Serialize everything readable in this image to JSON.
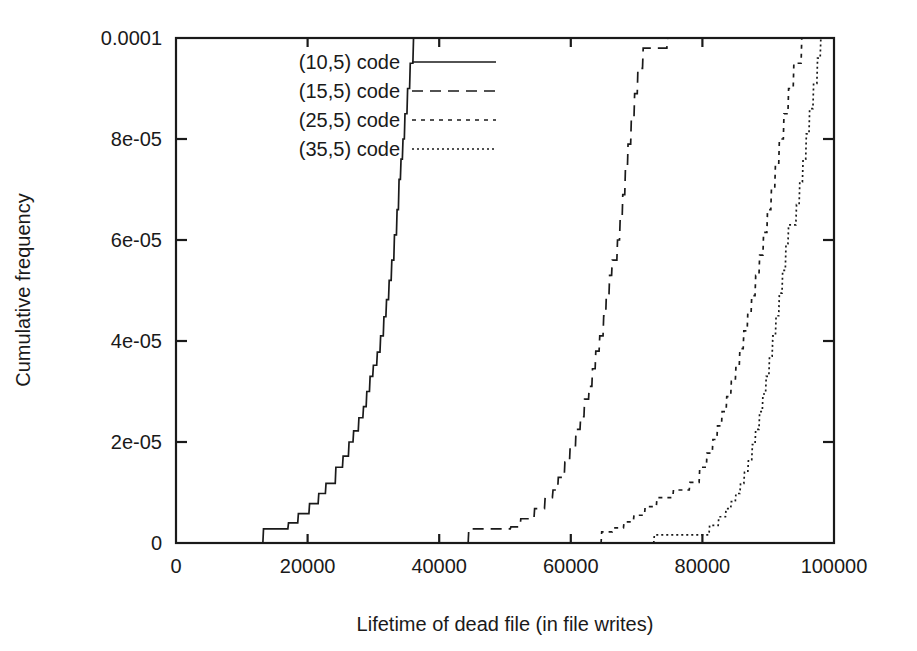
{
  "chart_data": {
    "type": "line",
    "title": "",
    "subtitle": "",
    "xlabel": "Lifetime of dead file (in file writes)",
    "ylabel": "Cumulative frequency",
    "xlim": [
      0,
      100000
    ],
    "ylim": [
      0,
      0.0001
    ],
    "grid": false,
    "legend_position": "top-left-inside",
    "xticks": [
      0,
      20000,
      40000,
      60000,
      80000,
      100000
    ],
    "xticklabels": [
      "0",
      "20000",
      "40000",
      "60000",
      "80000",
      "100000"
    ],
    "yticks": [
      0,
      2e-05,
      4e-05,
      6e-05,
      8e-05,
      0.0001
    ],
    "yticklabels": [
      "0",
      "2e-05",
      "4e-05",
      "6e-05",
      "8e-05",
      "0.0001"
    ],
    "series": [
      {
        "name": "(10,5) code",
        "linestyle": "solid",
        "dasharray": "",
        "points": [
          [
            13200,
            0.0
          ],
          [
            13300,
            2.8e-06
          ],
          [
            17000,
            2.8e-06
          ],
          [
            17100,
            4e-06
          ],
          [
            18500,
            4e-06
          ],
          [
            18600,
            5.8e-06
          ],
          [
            20200,
            5.8e-06
          ],
          [
            20300,
            7.8e-06
          ],
          [
            21600,
            7.8e-06
          ],
          [
            21700,
            9.8e-06
          ],
          [
            22700,
            9.8e-06
          ],
          [
            22800,
            1.18e-05
          ],
          [
            24200,
            1.18e-05
          ],
          [
            24300,
            1.5e-05
          ],
          [
            25300,
            1.5e-05
          ],
          [
            25400,
            1.72e-05
          ],
          [
            26200,
            1.72e-05
          ],
          [
            26300,
            2e-05
          ],
          [
            26900,
            2e-05
          ],
          [
            27000,
            2.22e-05
          ],
          [
            27700,
            2.22e-05
          ],
          [
            27800,
            2.48e-05
          ],
          [
            28400,
            2.48e-05
          ],
          [
            28500,
            2.7e-05
          ],
          [
            28900,
            2.7e-05
          ],
          [
            29000,
            3e-05
          ],
          [
            29400,
            3e-05
          ],
          [
            29500,
            3.3e-05
          ],
          [
            29900,
            3.3e-05
          ],
          [
            30000,
            3.52e-05
          ],
          [
            30500,
            3.52e-05
          ],
          [
            30600,
            3.78e-05
          ],
          [
            31000,
            3.78e-05
          ],
          [
            31100,
            4.1e-05
          ],
          [
            31500,
            4.1e-05
          ],
          [
            31600,
            4.48e-05
          ],
          [
            31900,
            4.48e-05
          ],
          [
            32000,
            4.82e-05
          ],
          [
            32300,
            4.82e-05
          ],
          [
            32400,
            5.2e-05
          ],
          [
            32700,
            5.2e-05
          ],
          [
            32800,
            5.6e-05
          ],
          [
            33100,
            5.6e-05
          ],
          [
            33200,
            6.1e-05
          ],
          [
            33500,
            6.1e-05
          ],
          [
            33600,
            6.6e-05
          ],
          [
            33800,
            6.6e-05
          ],
          [
            33900,
            7.2e-05
          ],
          [
            34100,
            7.2e-05
          ],
          [
            34200,
            7.6e-05
          ],
          [
            34400,
            7.6e-05
          ],
          [
            34500,
            8e-05
          ],
          [
            34700,
            8e-05
          ],
          [
            34800,
            8.5e-05
          ],
          [
            35100,
            8.5e-05
          ],
          [
            35200,
            9e-05
          ],
          [
            35500,
            9e-05
          ],
          [
            35600,
            9.5e-05
          ],
          [
            36000,
            9.5e-05
          ],
          [
            36100,
            0.0001
          ]
        ]
      },
      {
        "name": "(15,5) code",
        "linestyle": "dashed",
        "dasharray": "11,7",
        "points": [
          [
            44400,
            0.0
          ],
          [
            44500,
            2.8e-06
          ],
          [
            50800,
            2.8e-06
          ],
          [
            50900,
            3.2e-06
          ],
          [
            52300,
            3.2e-06
          ],
          [
            52400,
            4.8e-06
          ],
          [
            54400,
            4.8e-06
          ],
          [
            54500,
            6.8e-06
          ],
          [
            56000,
            6.8e-06
          ],
          [
            56100,
            9e-06
          ],
          [
            57200,
            9e-06
          ],
          [
            57300,
            1.05e-05
          ],
          [
            58000,
            1.05e-05
          ],
          [
            58100,
            1.3e-05
          ],
          [
            59000,
            1.3e-05
          ],
          [
            59100,
            1.6e-05
          ],
          [
            59800,
            1.6e-05
          ],
          [
            59900,
            1.9e-05
          ],
          [
            60700,
            1.9e-05
          ],
          [
            60800,
            2.25e-05
          ],
          [
            61400,
            2.25e-05
          ],
          [
            61500,
            2.5e-05
          ],
          [
            62000,
            2.5e-05
          ],
          [
            62100,
            2.85e-05
          ],
          [
            62700,
            2.85e-05
          ],
          [
            62800,
            3.1e-05
          ],
          [
            63200,
            3.1e-05
          ],
          [
            63300,
            3.45e-05
          ],
          [
            63700,
            3.45e-05
          ],
          [
            63800,
            3.8e-05
          ],
          [
            64300,
            3.8e-05
          ],
          [
            64400,
            4.1e-05
          ],
          [
            64900,
            4.1e-05
          ],
          [
            65000,
            4.5e-05
          ],
          [
            65300,
            4.5e-05
          ],
          [
            65400,
            4.9e-05
          ],
          [
            65800,
            4.9e-05
          ],
          [
            65900,
            5.3e-05
          ],
          [
            66200,
            5.3e-05
          ],
          [
            66300,
            5.6e-05
          ],
          [
            67000,
            5.6e-05
          ],
          [
            67100,
            6e-05
          ],
          [
            67400,
            6e-05
          ],
          [
            67500,
            6.4e-05
          ],
          [
            67800,
            6.4e-05
          ],
          [
            67900,
            6.9e-05
          ],
          [
            68200,
            6.9e-05
          ],
          [
            68300,
            7.4e-05
          ],
          [
            68600,
            7.4e-05
          ],
          [
            68700,
            7.9e-05
          ],
          [
            69100,
            7.9e-05
          ],
          [
            69200,
            8.4e-05
          ],
          [
            69600,
            8.4e-05
          ],
          [
            69700,
            8.9e-05
          ],
          [
            70100,
            8.9e-05
          ],
          [
            70200,
            9.4e-05
          ],
          [
            70900,
            9.4e-05
          ],
          [
            71000,
            9.8e-05
          ],
          [
            74600,
            9.8e-05
          ],
          [
            74700,
            0.0001
          ]
        ]
      },
      {
        "name": "(25,5) code",
        "linestyle": "dotted",
        "dasharray": "4,5",
        "points": [
          [
            64600,
            0.0
          ],
          [
            64700,
            2.2e-06
          ],
          [
            66300,
            2.2e-06
          ],
          [
            66400,
            3e-06
          ],
          [
            68000,
            3e-06
          ],
          [
            68100,
            4.2e-06
          ],
          [
            69500,
            4.2e-06
          ],
          [
            69600,
            5.5e-06
          ],
          [
            71200,
            5.5e-06
          ],
          [
            71300,
            7.2e-06
          ],
          [
            73000,
            7.2e-06
          ],
          [
            73100,
            9e-06
          ],
          [
            75500,
            9e-06
          ],
          [
            75600,
            1.05e-05
          ],
          [
            78000,
            1.05e-05
          ],
          [
            78100,
            1.2e-05
          ],
          [
            79500,
            1.2e-05
          ],
          [
            79600,
            1.5e-05
          ],
          [
            80600,
            1.5e-05
          ],
          [
            80700,
            1.78e-05
          ],
          [
            81500,
            1.78e-05
          ],
          [
            81600,
            2.05e-05
          ],
          [
            82200,
            2.05e-05
          ],
          [
            82300,
            2.32e-05
          ],
          [
            82900,
            2.32e-05
          ],
          [
            83000,
            2.6e-05
          ],
          [
            83600,
            2.6e-05
          ],
          [
            83700,
            2.9e-05
          ],
          [
            84300,
            2.9e-05
          ],
          [
            84400,
            3.2e-05
          ],
          [
            85000,
            3.2e-05
          ],
          [
            85100,
            3.5e-05
          ],
          [
            85600,
            3.5e-05
          ],
          [
            85700,
            3.85e-05
          ],
          [
            86200,
            3.85e-05
          ],
          [
            86300,
            4.2e-05
          ],
          [
            86800,
            4.2e-05
          ],
          [
            86900,
            4.55e-05
          ],
          [
            87400,
            4.55e-05
          ],
          [
            87500,
            4.9e-05
          ],
          [
            88000,
            4.9e-05
          ],
          [
            88100,
            5.3e-05
          ],
          [
            88600,
            5.3e-05
          ],
          [
            88700,
            5.7e-05
          ],
          [
            89200,
            5.7e-05
          ],
          [
            89300,
            6.15e-05
          ],
          [
            89800,
            6.15e-05
          ],
          [
            89900,
            6.6e-05
          ],
          [
            90400,
            6.6e-05
          ],
          [
            90500,
            7.05e-05
          ],
          [
            91000,
            7.05e-05
          ],
          [
            91100,
            7.5e-05
          ],
          [
            91600,
            7.5e-05
          ],
          [
            91700,
            8e-05
          ],
          [
            92300,
            8e-05
          ],
          [
            92400,
            8.5e-05
          ],
          [
            93000,
            8.5e-05
          ],
          [
            93100,
            9e-05
          ],
          [
            93800,
            9e-05
          ],
          [
            93900,
            9.5e-05
          ],
          [
            95000,
            9.5e-05
          ],
          [
            95100,
            0.0001
          ]
        ]
      },
      {
        "name": "(35,5) code",
        "linestyle": "fine-dotted",
        "dasharray": "2,3",
        "points": [
          [
            72600,
            0.0
          ],
          [
            72700,
            1.6e-06
          ],
          [
            81000,
            1.6e-06
          ],
          [
            81100,
            3.5e-06
          ],
          [
            82400,
            3.5e-06
          ],
          [
            82500,
            5.2e-06
          ],
          [
            83500,
            5.2e-06
          ],
          [
            83600,
            6.8e-06
          ],
          [
            84300,
            6.8e-06
          ],
          [
            84400,
            8.2e-06
          ],
          [
            85000,
            8.2e-06
          ],
          [
            85100,
            9.8e-06
          ],
          [
            85700,
            9.8e-06
          ],
          [
            85800,
            1.18e-05
          ],
          [
            86300,
            1.18e-05
          ],
          [
            86400,
            1.4e-05
          ],
          [
            86900,
            1.4e-05
          ],
          [
            87000,
            1.65e-05
          ],
          [
            87500,
            1.65e-05
          ],
          [
            87600,
            1.95e-05
          ],
          [
            88000,
            1.95e-05
          ],
          [
            88100,
            2.25e-05
          ],
          [
            88600,
            2.25e-05
          ],
          [
            88700,
            2.6e-05
          ],
          [
            89100,
            2.6e-05
          ],
          [
            89200,
            2.95e-05
          ],
          [
            89600,
            2.95e-05
          ],
          [
            89700,
            3.3e-05
          ],
          [
            90100,
            3.3e-05
          ],
          [
            90200,
            3.7e-05
          ],
          [
            90600,
            3.7e-05
          ],
          [
            90700,
            4.1e-05
          ],
          [
            91100,
            4.1e-05
          ],
          [
            91200,
            4.5e-05
          ],
          [
            91600,
            4.5e-05
          ],
          [
            91700,
            4.95e-05
          ],
          [
            92100,
            4.95e-05
          ],
          [
            92200,
            5.4e-05
          ],
          [
            92600,
            5.4e-05
          ],
          [
            92700,
            5.9e-05
          ],
          [
            93000,
            5.9e-05
          ],
          [
            93100,
            6.3e-05
          ],
          [
            94200,
            6.3e-05
          ],
          [
            94300,
            6.7e-05
          ],
          [
            94700,
            6.7e-05
          ],
          [
            94800,
            7.15e-05
          ],
          [
            95200,
            7.15e-05
          ],
          [
            95300,
            7.6e-05
          ],
          [
            95700,
            7.6e-05
          ],
          [
            95800,
            8.1e-05
          ],
          [
            96200,
            8.1e-05
          ],
          [
            96300,
            8.6e-05
          ],
          [
            96800,
            8.6e-05
          ],
          [
            96900,
            9.1e-05
          ],
          [
            97400,
            9.1e-05
          ],
          [
            97500,
            9.6e-05
          ],
          [
            97900,
            9.6e-05
          ],
          [
            98000,
            0.0001
          ]
        ]
      }
    ]
  },
  "colors": {
    "ink": "#1a1a1a",
    "background": "#ffffff"
  }
}
